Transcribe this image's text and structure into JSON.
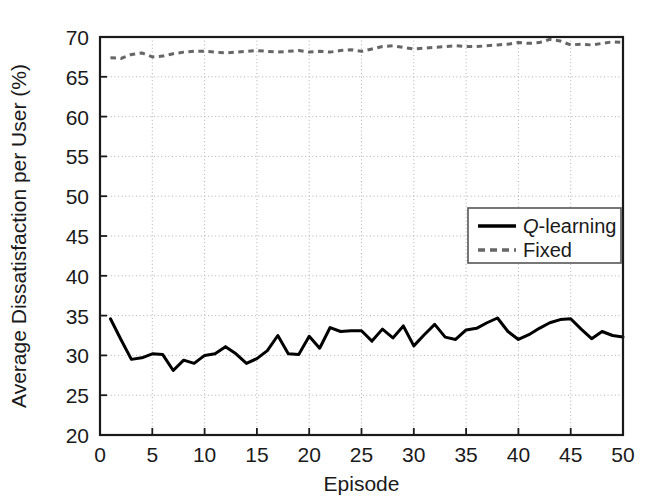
{
  "chart_data": {
    "type": "line",
    "title": "",
    "xlabel": "Episode",
    "ylabel": "Average Dissatisfaction per User (%)",
    "xlim": [
      0,
      50
    ],
    "ylim": [
      20,
      70
    ],
    "xticks": [
      0,
      5,
      10,
      15,
      20,
      25,
      30,
      35,
      40,
      45,
      50
    ],
    "yticks": [
      20,
      25,
      30,
      35,
      40,
      45,
      50,
      55,
      60,
      65,
      70
    ],
    "xtick_labels": [
      "0",
      "5",
      "10",
      "15",
      "20",
      "25",
      "30",
      "35",
      "40",
      "45",
      "50"
    ],
    "ytick_labels": [
      "20",
      "25",
      "30",
      "35",
      "40",
      "45",
      "50",
      "55",
      "60",
      "65",
      "70"
    ],
    "grid": true,
    "grid_style": "dotted",
    "grid_color": "#b0b0b0",
    "legend_position": "center-right",
    "x": [
      1,
      2,
      3,
      4,
      5,
      6,
      7,
      8,
      9,
      10,
      11,
      12,
      13,
      14,
      15,
      16,
      17,
      18,
      19,
      20,
      21,
      22,
      23,
      24,
      25,
      26,
      27,
      28,
      29,
      30,
      31,
      32,
      33,
      34,
      35,
      36,
      37,
      38,
      39,
      40,
      41,
      42,
      43,
      44,
      45,
      46,
      47,
      48,
      49,
      50
    ],
    "series": [
      {
        "name": "Q-learning",
        "name_italic_prefix": "Q",
        "name_rest": "-learning",
        "color": "#000000",
        "linestyle": "solid",
        "linewidth": 3,
        "values": [
          34.6,
          32.0,
          29.5,
          29.7,
          30.2,
          30.1,
          28.1,
          29.4,
          29.0,
          30.0,
          30.2,
          31.1,
          30.2,
          29.0,
          29.6,
          30.6,
          32.5,
          30.2,
          30.1,
          32.4,
          30.9,
          33.5,
          33.0,
          33.1,
          33.1,
          31.8,
          33.3,
          32.2,
          33.7,
          31.2,
          32.6,
          33.9,
          32.3,
          32.0,
          33.2,
          33.4,
          34.1,
          34.7,
          33.0,
          32.0,
          32.6,
          33.4,
          34.1,
          34.5,
          34.6,
          33.3,
          32.1,
          33.0,
          32.5,
          32.3
        ]
      },
      {
        "name": "Fixed",
        "color": "#666666",
        "linestyle": "dotted",
        "linewidth": 3,
        "values": [
          67.4,
          67.3,
          67.8,
          68.0,
          67.5,
          67.6,
          67.9,
          68.1,
          68.2,
          68.2,
          68.1,
          68.0,
          68.1,
          68.2,
          68.3,
          68.2,
          68.1,
          68.2,
          68.3,
          68.1,
          68.2,
          68.1,
          68.3,
          68.4,
          68.2,
          68.5,
          68.8,
          68.9,
          68.7,
          68.5,
          68.6,
          68.7,
          68.8,
          68.9,
          68.8,
          68.8,
          68.9,
          69.0,
          69.1,
          69.3,
          69.2,
          69.3,
          69.7,
          69.5,
          69.0,
          69.1,
          69.0,
          69.2,
          69.4,
          69.3
        ]
      }
    ]
  },
  "legend": {
    "entries": [
      {
        "label_italic": "Q",
        "label_rest": "-learning",
        "style": "solid",
        "color": "#000000"
      },
      {
        "label_italic": "",
        "label_rest": "Fixed",
        "style": "dotted",
        "color": "#666666"
      }
    ]
  }
}
